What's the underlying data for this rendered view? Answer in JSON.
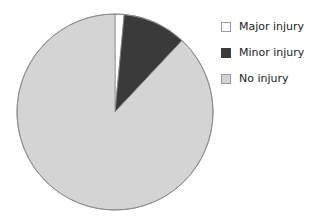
{
  "chart_data": {
    "type": "pie",
    "title": "",
    "subtitle": "",
    "xlabel": "",
    "ylabel": "",
    "grid": false,
    "legend_position": "right",
    "start_angle_deg": 90,
    "direction": "clockwise",
    "categories": [
      "Major injury",
      "Minor injury",
      "No injury"
    ],
    "values": [
      1.5,
      10.5,
      88.0
    ],
    "units": "percent",
    "colors": [
      "#ffffff",
      "#3a3a3a",
      "#d4d4d4"
    ],
    "slices": [
      {
        "label": "Major injury",
        "value": 1.5,
        "color": "#ffffff",
        "swatch": "sw-major"
      },
      {
        "label": "Minor injury",
        "value": 10.5,
        "color": "#3a3a3a",
        "swatch": "sw-minor"
      },
      {
        "label": "No injury",
        "value": 88.0,
        "color": "#d4d4d4",
        "swatch": "sw-none"
      }
    ]
  },
  "legend": {
    "items": [
      {
        "label": "Major injury",
        "swatch_name": "legend-swatch-major-injury",
        "swatch_class": "sw-major"
      },
      {
        "label": "Minor injury",
        "swatch_name": "legend-swatch-minor-injury",
        "swatch_class": "sw-minor"
      },
      {
        "label": "No injury",
        "swatch_name": "legend-swatch-no-injury",
        "swatch_class": "sw-none"
      }
    ]
  },
  "geometry": {
    "center_x": 115,
    "center_y": 112,
    "radius": 98,
    "outline_color": "#8c8c8c"
  }
}
